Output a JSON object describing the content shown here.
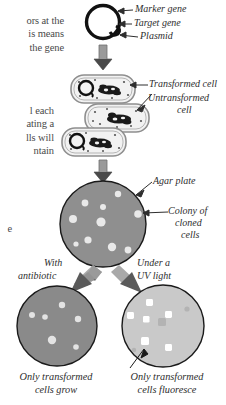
{
  "body_text": {
    "block1_lines": [
      "ors at the",
      "is means",
      "the gene"
    ],
    "block2_lines": [
      "l each",
      "ating a",
      "lls will",
      "ntain"
    ],
    "block3_lines": [
      "e"
    ]
  },
  "labels": {
    "marker_gene": "Marker gene",
    "target_gene": "Target gene",
    "plasmid": "Plasmid",
    "transformed_cell": "Transformed cell",
    "untransformed_cell_l1": "Untransformed",
    "untransformed_cell_l2": "cell",
    "agar_plate": "Agar plate",
    "colony_l1": "Colony of",
    "colony_l2": "cloned",
    "colony_l3": "cells",
    "with_antibiotic_l1": "With",
    "with_antibiotic_l2": "antibiotic",
    "under_uv_l1": "Under a",
    "under_uv_l2": "UV light"
  },
  "captions": {
    "left_l1": "Only transformed",
    "left_l2": "cells grow",
    "right_l1": "Only transformed",
    "right_l2": "cells fluoresce"
  },
  "colors": {
    "plasmid_stroke": "#111111",
    "cell_fill": "#f0f0f0",
    "cell_stroke": "#8a8a8a",
    "agar_gray": "#8f8f8f",
    "antibiotic_plate": "#8a8a8a",
    "uv_plate": "#c9c9c9",
    "colony_light": "#e8e8e8",
    "colony_white": "#ffffff",
    "arrow_gray": "#9a9a9a",
    "arrow_dark": "#4a4a4a",
    "leader_line": "#2e2e2e",
    "text": "#2e2e2e"
  },
  "diagram": {
    "plasmid": {
      "cx": 103,
      "cy": 22,
      "r": 17
    },
    "cells": [
      {
        "x": 71,
        "y": 75,
        "w": 64,
        "h": 28,
        "type": "transformed"
      },
      {
        "x": 85,
        "y": 104,
        "w": 64,
        "h": 28,
        "type": "untransformed"
      },
      {
        "x": 62,
        "y": 128,
        "w": 64,
        "h": 28,
        "type": "transformed"
      }
    ],
    "main_plate": {
      "cx": 103,
      "cy": 224,
      "r": 43
    },
    "main_plate_colonies": [
      [
        118,
        194,
        3.2
      ],
      [
        85,
        203,
        3.4
      ],
      [
        103,
        207,
        3.0
      ],
      [
        138,
        214,
        3.8
      ],
      [
        73,
        219,
        4.0
      ],
      [
        101,
        222,
        4.6
      ],
      [
        88,
        240,
        3.6
      ],
      [
        112,
        247,
        4.2
      ],
      [
        76,
        244,
        2.6
      ],
      [
        128,
        250,
        3.4
      ]
    ],
    "antibiotic_plate": {
      "cx": 57,
      "cy": 326,
      "r": 40
    },
    "antibiotic_colonies": [
      [
        62,
        305,
        3.2
      ],
      [
        45,
        317,
        2.8
      ],
      [
        32,
        315,
        3.0
      ],
      [
        78,
        319,
        3.2
      ],
      [
        52,
        340,
        4.2
      ],
      [
        76,
        347,
        2.8
      ]
    ],
    "uv_plate": {
      "cx": 163,
      "cy": 326,
      "r": 41
    },
    "uv_colonies": [
      [
        150,
        303,
        3.6
      ],
      [
        131,
        316,
        3.6
      ],
      [
        168,
        315,
        3.4
      ],
      [
        147,
        320,
        3.2
      ],
      [
        145,
        341,
        4.0
      ],
      [
        168,
        348,
        3.4
      ]
    ],
    "uv_faint": [
      [
        162,
        322,
        4.2
      ],
      [
        187,
        309,
        2.6
      ],
      [
        134,
        350,
        2.2
      ]
    ]
  }
}
